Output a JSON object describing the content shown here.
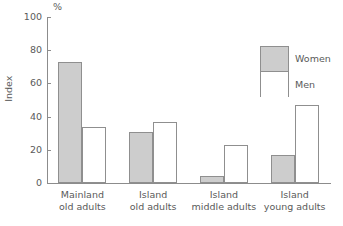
{
  "chart_data": {
    "type": "bar",
    "title": "",
    "xlabel": "",
    "ylabel": "Index",
    "unit": "%",
    "ylim": [
      0,
      100
    ],
    "yticks": [
      0,
      20,
      40,
      60,
      80,
      100
    ],
    "grid": false,
    "legend_position": "upper-right",
    "categories": [
      "Mainland old adults",
      "Island old adults",
      "Island middle adults",
      "Island young adults"
    ],
    "category_lines": [
      [
        "Mainland",
        "old adults"
      ],
      [
        "Island",
        "old adults"
      ],
      [
        "Island",
        "middle adults"
      ],
      [
        "Island",
        "young adults"
      ]
    ],
    "series": [
      {
        "name": "Women",
        "color": "#cdcdcd",
        "values": [
          73,
          31,
          4,
          17
        ]
      },
      {
        "name": "Men",
        "color": "#ffffff",
        "values": [
          34,
          37,
          23,
          47
        ]
      }
    ]
  },
  "axis": {
    "tick_0": "0",
    "tick_20": "20",
    "tick_40": "40",
    "tick_60": "60",
    "tick_80": "80",
    "tick_100": "100"
  },
  "legend": {
    "women_label": "Women",
    "men_label": "Men"
  }
}
